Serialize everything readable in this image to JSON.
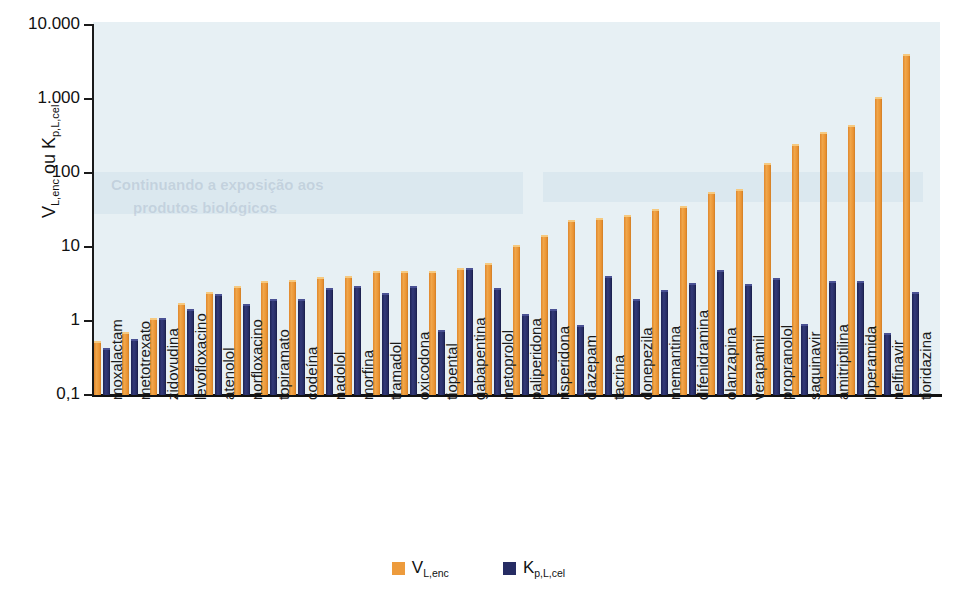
{
  "chart_data": {
    "type": "bar",
    "title": "",
    "subtitle": "",
    "xlabel": "",
    "ylabel": "V_L,enc ou K_p,L,cel",
    "ylabel_parts": {
      "first_var": "V",
      "first_sub": "L,enc",
      "conjunction": "ou",
      "second_var": "K",
      "second_sub": "p,L,cel"
    },
    "yscale": "log",
    "ylim": [
      0.1,
      10000
    ],
    "ytick_labels": [
      "10.000",
      "1.000",
      "100",
      "10",
      "1",
      "0,1"
    ],
    "ytick_values": [
      10000,
      1000,
      100,
      10,
      1,
      0.1
    ],
    "grid": false,
    "legend_position": "bottom-center",
    "categories": [
      "moxalactam",
      "metotrexato",
      "zidovudina",
      "levofloxacino",
      "atenolol",
      "norfloxacino",
      "topiramato",
      "codeína",
      "nadolol",
      "morfina",
      "tramadol",
      "oxicodona",
      "tiopental",
      "gabapentina",
      "metoprolol",
      "paliperidona",
      "risperidona",
      "diazepam",
      "tacrina",
      "donepezila",
      "memantina",
      "difenidramina",
      "olanzapina",
      "verapamil",
      "propranolol",
      "saquinavir",
      "amitriptilina",
      "loperamida",
      "nelfinavir",
      "tioridazina"
    ],
    "series": [
      {
        "name": "V_L,enc",
        "color": "#ed9b3c",
        "values": [
          0.54,
          0.72,
          1.1,
          1.75,
          2.5,
          2.95,
          3.5,
          3.6,
          3.9,
          4.1,
          4.8,
          4.8,
          4.8,
          5.2,
          6.0,
          10.8,
          14.5,
          23,
          25,
          27,
          33,
          36,
          56,
          60,
          135,
          250,
          360,
          440,
          1050,
          4100
        ]
      },
      {
        "name": "K_p,L,cel",
        "color": "#262c63",
        "values": [
          0.43,
          0.58,
          1.1,
          1.45,
          2.3,
          1.7,
          2.0,
          2.0,
          2.8,
          3.0,
          2.4,
          3.0,
          0.76,
          5.2,
          2.8,
          1.25,
          1.45,
          0.88,
          4.0,
          2.0,
          2.6,
          3.3,
          4.9,
          3.2,
          3.8,
          0.92,
          3.5,
          3.5,
          0.68,
          2.5
        ]
      }
    ]
  },
  "legend": {
    "items": [
      {
        "label_main": "V",
        "label_sub": "L,enc",
        "color": "#ed9b3c",
        "name": "v-l-enc"
      },
      {
        "label_main": "K",
        "label_sub": "p,L,cel",
        "color": "#262c63",
        "name": "k-p-l-cel"
      }
    ]
  },
  "background_text": {
    "line1": "Continuando a exposição aos",
    "line2": "produtos biológicos"
  }
}
